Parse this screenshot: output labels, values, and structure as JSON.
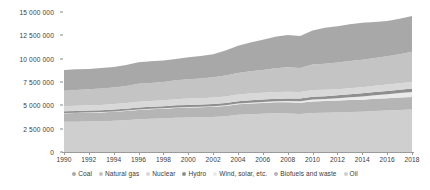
{
  "chart_data": {
    "type": "area",
    "stacked": true,
    "title": "",
    "subtitle": "",
    "xlabel": "",
    "ylabel": "",
    "grid": false,
    "legend_position": "bottom",
    "xlim": [
      1990,
      2018
    ],
    "ylim": [
      0,
      15000000
    ],
    "y_tick_values": [
      0,
      2500000,
      5000000,
      7500000,
      10000000,
      12500000,
      15000000
    ],
    "y_tick_labels": [
      "0",
      "2 500 000",
      "5 000 000",
      "7 500 000",
      "10 000 000",
      "12 500 000",
      "15 000 000"
    ],
    "x_tick_labels": [
      "1990",
      "1992",
      "1994",
      "1996",
      "1998",
      "2000",
      "2002",
      "2004",
      "2006",
      "2008",
      "2010",
      "2012",
      "2014",
      "2016",
      "2018"
    ],
    "x": [
      1990,
      1991,
      1992,
      1993,
      1994,
      1995,
      1996,
      1997,
      1998,
      1999,
      2000,
      2001,
      2002,
      2003,
      2004,
      2005,
      2006,
      2007,
      2008,
      2009,
      2010,
      2011,
      2012,
      2013,
      2014,
      2015,
      2016,
      2017,
      2018
    ],
    "series": [
      {
        "name": "Coal",
        "color": "#a8a8a8",
        "values": [
          2220000,
          2210000,
          2180000,
          2190000,
          2200000,
          2250000,
          2310000,
          2320000,
          2300000,
          2290000,
          2340000,
          2400000,
          2480000,
          2700000,
          2900000,
          3080000,
          3230000,
          3380000,
          3460000,
          3430000,
          3650000,
          3840000,
          3880000,
          3950000,
          3960000,
          3870000,
          3780000,
          3790000,
          3840000
        ]
      },
      {
        "name": "Natural gas",
        "color": "#c4c4c4",
        "values": [
          1670000,
          1700000,
          1710000,
          1750000,
          1780000,
          1830000,
          1920000,
          1930000,
          1970000,
          2020000,
          2080000,
          2120000,
          2180000,
          2250000,
          2320000,
          2390000,
          2450000,
          2550000,
          2610000,
          2580000,
          2740000,
          2800000,
          2870000,
          2910000,
          2930000,
          2970000,
          3040000,
          3110000,
          3240000
        ]
      },
      {
        "name": "Nuclear",
        "color": "#d8d8d8",
        "values": [
          526000,
          548000,
          555000,
          578000,
          589000,
          609000,
          634000,
          628000,
          638000,
          661000,
          675000,
          687000,
          692000,
          687000,
          714000,
          721000,
          728000,
          709000,
          712000,
          703000,
          719000,
          674000,
          642000,
          646000,
          661000,
          671000,
          680000,
          688000,
          707000
        ]
      },
      {
        "name": "Hydro",
        "color": "#8f8f8f",
        "values": [
          184000,
          188000,
          190000,
          197000,
          200000,
          207000,
          213000,
          214000,
          219000,
          222000,
          226000,
          225000,
          229000,
          230000,
          242000,
          250000,
          259000,
          265000,
          277000,
          285000,
          297000,
          306000,
          318000,
          330000,
          341000,
          345000,
          355000,
          361000,
          370000
        ]
      },
      {
        "name": "Wind, solar, etc.",
        "color": "#eaeaea",
        "values": [
          28000,
          29000,
          31000,
          33000,
          35000,
          38000,
          40000,
          43000,
          47000,
          52000,
          58000,
          63000,
          70000,
          78000,
          88000,
          99000,
          112000,
          128000,
          148000,
          168000,
          195000,
          225000,
          258000,
          295000,
          335000,
          375000,
          420000,
          470000,
          525000
        ]
      },
      {
        "name": "Biofuels and waste",
        "color": "#b5b5b5",
        "values": [
          930000,
          940000,
          950000,
          960000,
          975000,
          990000,
          1005000,
          1015000,
          1030000,
          1045000,
          1060000,
          1070000,
          1085000,
          1100000,
          1120000,
          1140000,
          1160000,
          1180000,
          1200000,
          1215000,
          1240000,
          1255000,
          1270000,
          1285000,
          1300000,
          1310000,
          1320000,
          1335000,
          1350000
        ]
      },
      {
        "name": "Oil",
        "color": "#cfcfcf",
        "values": [
          3230000,
          3240000,
          3280000,
          3280000,
          3340000,
          3410000,
          3500000,
          3570000,
          3600000,
          3680000,
          3700000,
          3720000,
          3750000,
          3840000,
          3990000,
          4050000,
          4090000,
          4140000,
          4120000,
          4060000,
          4180000,
          4200000,
          4240000,
          4280000,
          4310000,
          4390000,
          4450000,
          4510000,
          4550000
        ]
      }
    ]
  }
}
